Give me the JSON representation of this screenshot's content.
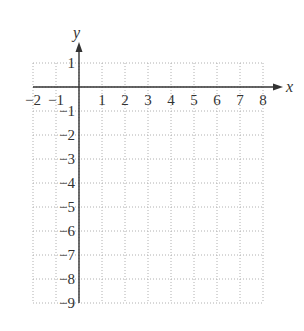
{
  "chart_data": {
    "type": "coordinate-grid",
    "title": "",
    "xlabel": "x",
    "ylabel": "y",
    "xlim": [
      -2,
      8
    ],
    "ylim": [
      -9,
      1
    ],
    "grid": true,
    "grid_style": "dotted",
    "x_ticks": [
      "−2",
      "−1",
      "1",
      "2",
      "3",
      "4",
      "5",
      "6",
      "7",
      "8"
    ],
    "x_tick_values": [
      -2,
      -1,
      1,
      2,
      3,
      4,
      5,
      6,
      7,
      8
    ],
    "y_ticks": [
      "1",
      "−1",
      "−2",
      "−3",
      "−4",
      "−5",
      "−6",
      "−7",
      "−8",
      "−9"
    ],
    "y_tick_values": [
      1,
      -1,
      -2,
      -3,
      -4,
      -5,
      -6,
      -7,
      -8,
      -9
    ],
    "series": []
  },
  "colors": {
    "axis": "#333333",
    "grid": "#b0b0b0",
    "text": "#333333",
    "background": "#ffffff"
  },
  "layout": {
    "origin_px": [
      79,
      87
    ],
    "unit_x_px": 23,
    "unit_y_px": 24,
    "x_arrow_end_px": 283,
    "y_arrow_end_px": 42
  }
}
